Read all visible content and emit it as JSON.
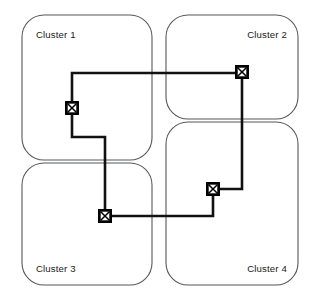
{
  "diagram": {
    "type": "network-topology",
    "width": 321,
    "height": 300,
    "background_color": "#ffffff",
    "cluster_outline_color": "#55585c",
    "link_color": "#111111",
    "node_fill_color": "#000000",
    "node_inner_color": "#ffffff",
    "label_color": "#1a1a1a",
    "clusters": [
      {
        "id": "cluster-1",
        "label": "Cluster 1",
        "label_align": "left",
        "box": {
          "x": 22,
          "y": 15,
          "width": 130,
          "height": 145,
          "radius": 22
        },
        "label_pos": {
          "x": 36,
          "y": 38
        }
      },
      {
        "id": "cluster-2",
        "label": "Cluster 2",
        "label_align": "right",
        "box": {
          "x": 166,
          "y": 15,
          "width": 132,
          "height": 104,
          "radius": 22
        },
        "label_pos": {
          "x": 287,
          "y": 38
        }
      },
      {
        "id": "cluster-3",
        "label": "Cluster 3",
        "label_align": "left",
        "box": {
          "x": 22,
          "y": 163,
          "width": 130,
          "height": 122,
          "radius": 22
        },
        "label_pos": {
          "x": 36,
          "y": 272
        }
      },
      {
        "id": "cluster-4",
        "label": "Cluster 4",
        "label_align": "right",
        "box": {
          "x": 166,
          "y": 122,
          "width": 132,
          "height": 163,
          "radius": 22
        },
        "label_pos": {
          "x": 287,
          "y": 272
        }
      }
    ],
    "nodes": [
      {
        "id": "node-cluster-1",
        "cluster": "cluster-1",
        "icon": "switch-node-icon",
        "x": 72,
        "y": 108,
        "size": 13
      },
      {
        "id": "node-cluster-2",
        "cluster": "cluster-2",
        "icon": "switch-node-icon",
        "x": 242,
        "y": 72,
        "size": 13
      },
      {
        "id": "node-cluster-3",
        "cluster": "cluster-3",
        "icon": "switch-node-icon",
        "x": 105,
        "y": 216,
        "size": 13
      },
      {
        "id": "node-cluster-4",
        "cluster": "cluster-4",
        "icon": "switch-node-icon",
        "x": 213,
        "y": 189,
        "size": 13
      }
    ],
    "links": [
      {
        "id": "link-1-to-2",
        "from": "node-cluster-1",
        "to": "node-cluster-2",
        "path": "M 72 102 L 72 73 L 236 73"
      },
      {
        "id": "link-2-to-4",
        "from": "node-cluster-2",
        "to": "node-cluster-4",
        "path": "M 242 78 L 242 189 L 219 189"
      },
      {
        "id": "link-4-to-3",
        "from": "node-cluster-4",
        "to": "node-cluster-3",
        "path": "M 213 195 L 213 216 L 111 216"
      },
      {
        "id": "link-3-to-1",
        "from": "node-cluster-3",
        "to": "node-cluster-1",
        "path": "M 105 210 L 105 137 L 72 137 L 72 114"
      }
    ]
  }
}
